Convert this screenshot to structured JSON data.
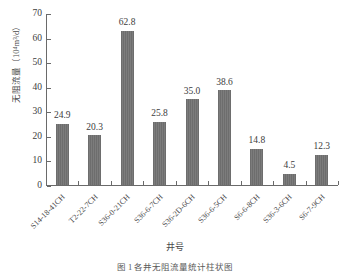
{
  "chart_data": {
    "type": "bar",
    "title": "",
    "xlabel": "井号",
    "ylabel": "无阻流量（10⁴m³/d）",
    "ylim": [
      0,
      70
    ],
    "yticks": [
      0,
      10,
      20,
      30,
      40,
      50,
      60,
      70
    ],
    "grid": false,
    "legend": "none",
    "categories": [
      "S14-18-41CH",
      "T2-22-7CH",
      "S36-0-21CH",
      "S36-6-7CH",
      "S36-2D-6CH",
      "S36-6-5CH",
      "S6-6-8CH",
      "S36-3-6CH",
      "S6-7-9CH"
    ],
    "values": [
      24.9,
      20.3,
      62.8,
      25.8,
      35.0,
      38.6,
      14.8,
      4.5,
      12.3
    ],
    "value_labels": [
      "24.9",
      "20.3",
      "62.8",
      "25.8",
      "35.0",
      "38.6",
      "14.8",
      "4.5",
      "12.3"
    ],
    "bar_color": "#6f6f6f",
    "axis_color": "#6a6a6a"
  },
  "axis": {
    "y_title_main": "无阻流量（10",
    "y_title_sup": "4",
    "y_title_tail": "m³/d）",
    "x_title": "井号"
  },
  "caption": {
    "text": "图 1   各井无阻流量统计柱状图"
  }
}
